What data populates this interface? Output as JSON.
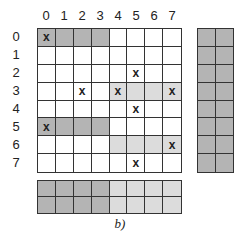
{
  "figure": {
    "caption": "b)",
    "column_labels": [
      "0",
      "1",
      "2",
      "3",
      "4",
      "5",
      "6",
      "7"
    ],
    "row_labels": [
      "0",
      "1",
      "2",
      "3",
      "4",
      "5",
      "6",
      "7"
    ],
    "colors": {
      "white": "#ffffff",
      "dark": "#b4b4b4",
      "light": "#dcdcdc",
      "grid_line": "#333333"
    },
    "main_grid": {
      "rows": [
        {
          "cells": [
            {
              "shade": "dark",
              "mark": "x"
            },
            {
              "shade": "dark",
              "mark": ""
            },
            {
              "shade": "dark",
              "mark": ""
            },
            {
              "shade": "dark",
              "mark": ""
            },
            {
              "shade": "white",
              "mark": ""
            },
            {
              "shade": "white",
              "mark": ""
            },
            {
              "shade": "white",
              "mark": ""
            },
            {
              "shade": "white",
              "mark": ""
            }
          ]
        },
        {
          "cells": [
            {
              "shade": "white",
              "mark": ""
            },
            {
              "shade": "white",
              "mark": ""
            },
            {
              "shade": "white",
              "mark": ""
            },
            {
              "shade": "white",
              "mark": ""
            },
            {
              "shade": "white",
              "mark": ""
            },
            {
              "shade": "white",
              "mark": ""
            },
            {
              "shade": "white",
              "mark": ""
            },
            {
              "shade": "white",
              "mark": ""
            }
          ]
        },
        {
          "cells": [
            {
              "shade": "white",
              "mark": ""
            },
            {
              "shade": "white",
              "mark": ""
            },
            {
              "shade": "white",
              "mark": ""
            },
            {
              "shade": "white",
              "mark": ""
            },
            {
              "shade": "white",
              "mark": ""
            },
            {
              "shade": "white",
              "mark": "x"
            },
            {
              "shade": "white",
              "mark": ""
            },
            {
              "shade": "white",
              "mark": ""
            }
          ]
        },
        {
          "cells": [
            {
              "shade": "white",
              "mark": ""
            },
            {
              "shade": "white",
              "mark": ""
            },
            {
              "shade": "white",
              "mark": "x"
            },
            {
              "shade": "white",
              "mark": ""
            },
            {
              "shade": "light",
              "mark": "x"
            },
            {
              "shade": "light",
              "mark": ""
            },
            {
              "shade": "light",
              "mark": ""
            },
            {
              "shade": "light",
              "mark": "x"
            }
          ]
        },
        {
          "cells": [
            {
              "shade": "white",
              "mark": ""
            },
            {
              "shade": "white",
              "mark": ""
            },
            {
              "shade": "white",
              "mark": ""
            },
            {
              "shade": "white",
              "mark": ""
            },
            {
              "shade": "white",
              "mark": ""
            },
            {
              "shade": "white",
              "mark": "x"
            },
            {
              "shade": "white",
              "mark": ""
            },
            {
              "shade": "white",
              "mark": ""
            }
          ]
        },
        {
          "cells": [
            {
              "shade": "dark",
              "mark": "x"
            },
            {
              "shade": "dark",
              "mark": ""
            },
            {
              "shade": "dark",
              "mark": ""
            },
            {
              "shade": "dark",
              "mark": ""
            },
            {
              "shade": "white",
              "mark": ""
            },
            {
              "shade": "white",
              "mark": ""
            },
            {
              "shade": "white",
              "mark": ""
            },
            {
              "shade": "white",
              "mark": ""
            }
          ]
        },
        {
          "cells": [
            {
              "shade": "white",
              "mark": ""
            },
            {
              "shade": "white",
              "mark": ""
            },
            {
              "shade": "white",
              "mark": ""
            },
            {
              "shade": "white",
              "mark": ""
            },
            {
              "shade": "light",
              "mark": ""
            },
            {
              "shade": "light",
              "mark": ""
            },
            {
              "shade": "light",
              "mark": ""
            },
            {
              "shade": "light",
              "mark": "x"
            }
          ]
        },
        {
          "cells": [
            {
              "shade": "white",
              "mark": ""
            },
            {
              "shade": "white",
              "mark": ""
            },
            {
              "shade": "white",
              "mark": ""
            },
            {
              "shade": "white",
              "mark": ""
            },
            {
              "shade": "white",
              "mark": ""
            },
            {
              "shade": "white",
              "mark": "x"
            },
            {
              "shade": "white",
              "mark": ""
            },
            {
              "shade": "white",
              "mark": ""
            }
          ]
        }
      ]
    },
    "side_grid": {
      "columns": 2,
      "rows": 8,
      "shade": "dark"
    },
    "bottom_grid": {
      "rows": 2,
      "column_shades": [
        "dark",
        "dark",
        "dark",
        "dark",
        "light",
        "light",
        "light",
        "light"
      ]
    }
  }
}
